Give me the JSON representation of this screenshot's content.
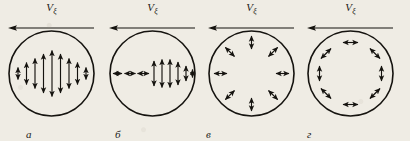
{
  "figure": {
    "background_color": "#efece4",
    "ink_color": "#15130f",
    "width": 410,
    "height": 141
  },
  "panels": [
    {
      "id": "a",
      "letter": "а",
      "velocity_label": "V",
      "velocity_subscript": "ξ",
      "velocity_direction": "left",
      "pattern_name": "linear-vertical-polarization",
      "pattern_description": "Vertical double-headed arrows across a horizontal diameter, longest at the centre and shortening toward the rim",
      "arrow_count": 9
    },
    {
      "id": "b",
      "letter": "б",
      "velocity_label": "V",
      "velocity_subscript": "ξ",
      "velocity_direction": "left",
      "pattern_name": "mixed-longitudinal-transverse-polarization",
      "pattern_description": "Horizontal double-headed arrows on the left half and vertical double-headed arrows on the right half, along a horizontal diameter",
      "arrow_count": 9
    },
    {
      "id": "v",
      "letter": "в",
      "velocity_label": "V",
      "velocity_subscript": "ξ",
      "velocity_direction": "left",
      "pattern_name": "radial-polarization",
      "pattern_description": "Eight double-headed arrows pointing radially outward, evenly spaced around the circle",
      "arrow_count": 8
    },
    {
      "id": "g",
      "letter": "г",
      "velocity_label": "V",
      "velocity_subscript": "ξ",
      "velocity_direction": "left",
      "pattern_name": "tangential-azimuthal-polarization",
      "pattern_description": "Eight double-headed arrows oriented tangentially around the rim of the circle",
      "arrow_count": 8
    }
  ]
}
